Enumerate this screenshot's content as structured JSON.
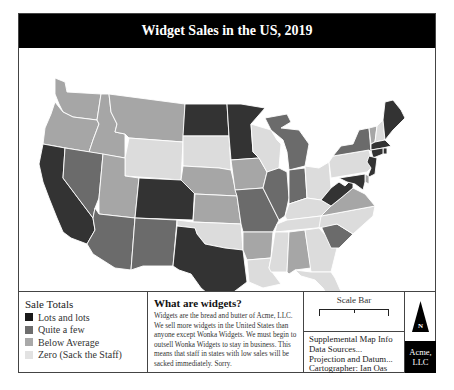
{
  "header": {
    "title": "Widget Sales in the US, 2019"
  },
  "colors": {
    "lots": "#333333",
    "quite_a_few": "#6b6b6b",
    "below_average": "#a6a6a6",
    "zero": "#dcdcdc",
    "border": "#ffffff"
  },
  "legend": {
    "title": "Sale Totals",
    "items": [
      {
        "label": "Lots and lots",
        "color": "#1a1a1a"
      },
      {
        "label": "Quite a few",
        "color": "#6e6e6e"
      },
      {
        "label": "Below Average",
        "color": "#a9a9a9"
      },
      {
        "label": "Zero (Sack the Staff)",
        "color": "#e2e2e2"
      }
    ]
  },
  "about": {
    "title": "What are widgets?",
    "body": "Widgets are the bread and butter of Acme, LLC. We sell more widgets in the United States than anyone except Wonka Widgets. We must begin to outsell Wonka Widgets to stay in business. This means that staff in states with low sales will be sacked immediately. Sorry."
  },
  "scale": {
    "label": "Scale Bar"
  },
  "info": {
    "lines": [
      "Supplemental Map Info",
      "Data Sources...",
      "Projection and Datum...",
      "Cartographer: Ian Oas"
    ]
  },
  "north_arrow": {
    "label": "N"
  },
  "logo": {
    "line1": "Acme,",
    "line2": "LLC"
  },
  "states": [
    {
      "name": "WA",
      "class": "below_average"
    },
    {
      "name": "OR",
      "class": "below_average"
    },
    {
      "name": "CA",
      "class": "lots"
    },
    {
      "name": "ID",
      "class": "below_average"
    },
    {
      "name": "NV",
      "class": "quite_a_few"
    },
    {
      "name": "MT",
      "class": "below_average"
    },
    {
      "name": "WY",
      "class": "zero"
    },
    {
      "name": "UT",
      "class": "below_average"
    },
    {
      "name": "AZ",
      "class": "quite_a_few"
    },
    {
      "name": "CO",
      "class": "lots"
    },
    {
      "name": "NM",
      "class": "quite_a_few"
    },
    {
      "name": "ND",
      "class": "lots"
    },
    {
      "name": "SD",
      "class": "zero"
    },
    {
      "name": "NE",
      "class": "below_average"
    },
    {
      "name": "KS",
      "class": "below_average"
    },
    {
      "name": "OK",
      "class": "zero"
    },
    {
      "name": "TX",
      "class": "lots"
    },
    {
      "name": "MN",
      "class": "lots"
    },
    {
      "name": "IA",
      "class": "below_average"
    },
    {
      "name": "MO",
      "class": "quite_a_few"
    },
    {
      "name": "AR",
      "class": "below_average"
    },
    {
      "name": "LA",
      "class": "zero"
    },
    {
      "name": "WI",
      "class": "zero"
    },
    {
      "name": "IL",
      "class": "quite_a_few"
    },
    {
      "name": "MI",
      "class": "quite_a_few"
    },
    {
      "name": "IN",
      "class": "quite_a_few"
    },
    {
      "name": "OH",
      "class": "zero"
    },
    {
      "name": "KY",
      "class": "zero"
    },
    {
      "name": "TN",
      "class": "zero"
    },
    {
      "name": "MS",
      "class": "zero"
    },
    {
      "name": "AL",
      "class": "below_average"
    },
    {
      "name": "GA",
      "class": "zero"
    },
    {
      "name": "FL",
      "class": "zero"
    },
    {
      "name": "SC",
      "class": "quite_a_few"
    },
    {
      "name": "NC",
      "class": "zero"
    },
    {
      "name": "VA",
      "class": "below_average"
    },
    {
      "name": "WV",
      "class": "lots"
    },
    {
      "name": "PA",
      "class": "zero"
    },
    {
      "name": "NY",
      "class": "quite_a_few"
    },
    {
      "name": "VT",
      "class": "below_average"
    },
    {
      "name": "NH",
      "class": "zero"
    },
    {
      "name": "ME",
      "class": "lots"
    },
    {
      "name": "MA",
      "class": "lots"
    },
    {
      "name": "CT",
      "class": "lots"
    },
    {
      "name": "RI",
      "class": "lots"
    },
    {
      "name": "NJ",
      "class": "lots"
    },
    {
      "name": "DE",
      "class": "below_average"
    },
    {
      "name": "MD",
      "class": "lots"
    }
  ]
}
